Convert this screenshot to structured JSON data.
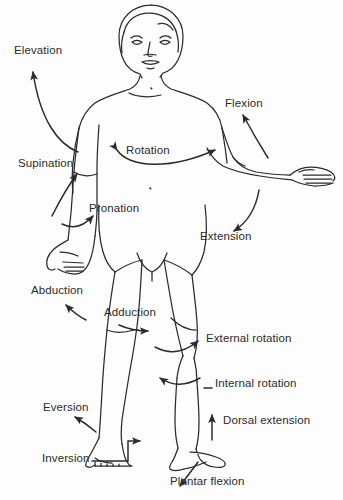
{
  "diagram": {
    "line_color": "#2b2b2b",
    "background_color": "#fdfdfd",
    "labels": [
      {
        "id": "elevation",
        "text": "Elevation",
        "x": 14,
        "y": 45,
        "region": "left shoulder"
      },
      {
        "id": "flexion",
        "text": "Flexion",
        "x": 225,
        "y": 98,
        "region": "right shoulder"
      },
      {
        "id": "rotation",
        "text": "Rotation",
        "x": 126,
        "y": 145,
        "region": "trunk"
      },
      {
        "id": "supination",
        "text": "Supination",
        "x": 18,
        "y": 158,
        "region": "left forearm"
      },
      {
        "id": "pronation",
        "text": "Pronation",
        "x": 89,
        "y": 203,
        "region": "left forearm"
      },
      {
        "id": "extension",
        "text": "Extension",
        "x": 200,
        "y": 231,
        "region": "right shoulder"
      },
      {
        "id": "abduction",
        "text": "Abduction",
        "x": 31,
        "y": 285,
        "region": "left hip"
      },
      {
        "id": "adduction",
        "text": "Adduction",
        "x": 104,
        "y": 307,
        "region": "right hip"
      },
      {
        "id": "external-rotation",
        "text": "External rotation",
        "x": 206,
        "y": 333,
        "region": "right knee"
      },
      {
        "id": "internal-rotation",
        "text": "Internal rotation",
        "x": 215,
        "y": 378,
        "region": "right knee"
      },
      {
        "id": "dorsal-extension",
        "text": "Dorsal extension",
        "x": 223,
        "y": 415,
        "region": "right ankle"
      },
      {
        "id": "eversion",
        "text": "Eversion",
        "x": 43,
        "y": 402,
        "region": "left foot"
      },
      {
        "id": "inversion",
        "text": "Inversion",
        "x": 42,
        "y": 453,
        "region": "left foot"
      },
      {
        "id": "plantar-flexion",
        "text": "Plantar flexion",
        "x": 170,
        "y": 476,
        "region": "right ankle"
      }
    ]
  }
}
